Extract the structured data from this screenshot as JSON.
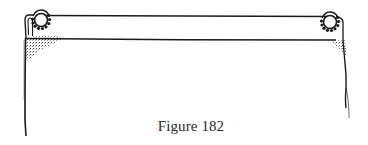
{
  "figure": {
    "caption": "Figure 182",
    "ink_color": "#1a1a1a",
    "background": "#ffffff",
    "elements": {
      "rod": "curtain-rod",
      "left_ring": "curtain-ring-icon",
      "right_ring": "curtain-ring-icon",
      "fabric": "hanging-fabric-panel"
    }
  }
}
